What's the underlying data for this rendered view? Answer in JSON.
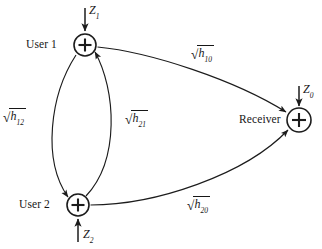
{
  "figure": {
    "type": "block-diagram"
  },
  "nodes": [
    {
      "id": "user1",
      "label": "User 1",
      "symbol": "+",
      "cx": 85,
      "cy": 45,
      "r": 11
    },
    {
      "id": "user2",
      "label": "User 2",
      "symbol": "+",
      "cx": 78,
      "cy": 205,
      "r": 11
    },
    {
      "id": "receiver",
      "label": "Receiver",
      "symbol": "+",
      "cx": 299,
      "cy": 120,
      "r": 12
    }
  ],
  "noise_inputs": [
    {
      "id": "z1",
      "base": "Z",
      "sub": "1",
      "target": "user1",
      "direction": "down"
    },
    {
      "id": "z2",
      "base": "Z",
      "sub": "2",
      "target": "user2",
      "direction": "up"
    },
    {
      "id": "z0",
      "base": "Z",
      "sub": "0",
      "target": "receiver",
      "direction": "down"
    }
  ],
  "edges": [
    {
      "id": "h10",
      "from": "user1",
      "to": "receiver",
      "base": "h",
      "sub": "10",
      "label_prefix": "√"
    },
    {
      "id": "h20",
      "from": "user2",
      "to": "receiver",
      "base": "h",
      "sub": "20",
      "label_prefix": "√"
    },
    {
      "id": "h12",
      "from": "user1",
      "to": "user2",
      "base": "h",
      "sub": "12",
      "label_prefix": "√"
    },
    {
      "id": "h21",
      "from": "user2",
      "to": "user1",
      "base": "h",
      "sub": "21",
      "label_prefix": "√"
    }
  ],
  "colors": {
    "stroke": "#1c1c1c",
    "text": "#161616",
    "background": "#ffffff"
  }
}
